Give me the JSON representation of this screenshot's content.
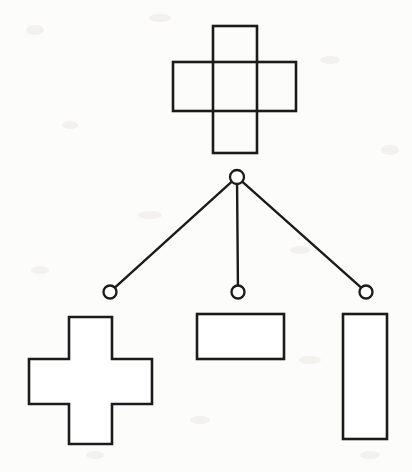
{
  "figure": {
    "title": "Shape decomposition tree",
    "caption": "",
    "background_color": "#fcfcfb",
    "ink_color": "#1b1b1b",
    "width": 412,
    "height": 472
  },
  "diagram": {
    "type": "tree",
    "orientation": "top-down",
    "root_label": "",
    "parent_shape": {
      "name": "cross-outline-overlapping-rectangles",
      "description": "Plus/cross formed by a vertical rectangle overlapping a horizontal rectangle, interior crossing lines visible",
      "bounds": {
        "x": 173,
        "y": 26,
        "width": 123,
        "height": 127
      },
      "vertical_rect": {
        "x": 213,
        "y": 26,
        "width": 44,
        "height": 127
      },
      "horizontal_rect": {
        "x": 173,
        "y": 62,
        "width": 123,
        "height": 49
      },
      "stroke_color": "#1b1b1b",
      "fill_color": "#ffffff"
    },
    "root_node": {
      "name": "root-node",
      "cx": 237,
      "cy": 177,
      "r": 7,
      "label": ""
    },
    "child_nodes": [
      {
        "name": "child-node-left",
        "cx": 110,
        "cy": 292,
        "r": 6.5,
        "label": ""
      },
      {
        "name": "child-node-center",
        "cx": 238,
        "cy": 292,
        "r": 6.5,
        "label": ""
      },
      {
        "name": "child-node-right",
        "cx": 366,
        "cy": 292,
        "r": 6.5,
        "label": ""
      }
    ],
    "edges": [
      {
        "name": "edge-root-to-left",
        "from": "root-node",
        "to": "child-node-left"
      },
      {
        "name": "edge-root-to-center",
        "from": "root-node",
        "to": "child-node-center"
      },
      {
        "name": "edge-root-to-right",
        "from": "root-node",
        "to": "child-node-right"
      }
    ],
    "child_shapes": [
      {
        "name": "cross-polygon",
        "description": "Solid plus/cross outline with no interior lines",
        "bounds": {
          "x": 29,
          "y": 317,
          "width": 123,
          "height": 127
        },
        "vertical_bar": {
          "x": 69,
          "y": 317,
          "width": 43,
          "height": 127
        },
        "horizontal_bar": {
          "x": 29,
          "y": 359,
          "width": 123,
          "height": 45
        },
        "label": ""
      },
      {
        "name": "horizontal-rectangle",
        "description": "Wide landscape rectangle",
        "bounds": {
          "x": 197,
          "y": 314,
          "width": 87,
          "height": 45
        },
        "label": ""
      },
      {
        "name": "vertical-rectangle",
        "description": "Tall portrait rectangle",
        "bounds": {
          "x": 343,
          "y": 314,
          "width": 44,
          "height": 125
        },
        "label": ""
      }
    ]
  }
}
